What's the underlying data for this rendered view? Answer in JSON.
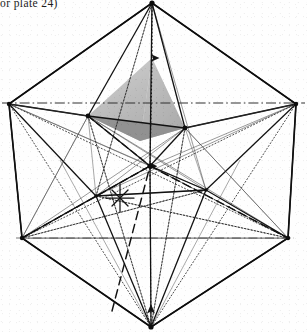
{
  "page": {
    "width": 307,
    "height": 332,
    "background_color": "#fefefe",
    "ink_color": "#141414"
  },
  "caption": {
    "text": "or plate  24)",
    "note": "partially cropped running caption fragment at top-left"
  },
  "figure": {
    "name": "polyhedron-with-inscribed-tetrahedron",
    "shaded_face_fill": "#bcbcbc",
    "shaded_face_fill_light": "#d2d2d2",
    "shaded_face_fill_dark": "#8e8e8e",
    "line_weights": {
      "outline": 1.6,
      "solid": 1.15,
      "thin": 0.7,
      "dashed": 1.3,
      "dotted": 0.85
    },
    "vertices": {
      "top_apex": {
        "x": 152,
        "y": 3
      },
      "bottom_apex": {
        "x": 151,
        "y": 327
      },
      "left_upper": {
        "x": 9,
        "y": 104
      },
      "right_upper": {
        "x": 296,
        "y": 104
      },
      "left_lower": {
        "x": 22,
        "y": 238
      },
      "right_lower": {
        "x": 288,
        "y": 238
      },
      "inner_left_up": {
        "x": 88,
        "y": 116
      },
      "inner_right_up": {
        "x": 185,
        "y": 128
      },
      "inner_center": {
        "x": 150,
        "y": 166
      },
      "inner_left_low": {
        "x": 96,
        "y": 196
      },
      "inner_right_low": {
        "x": 206,
        "y": 190
      },
      "tetra_apex": {
        "x": 152,
        "y": 58
      },
      "tetra_front": {
        "x": 140,
        "y": 140
      }
    },
    "arrow_markers": [
      {
        "name": "axis-arrow-upper",
        "x": 152,
        "y": 60
      },
      {
        "name": "axis-arrow-mid",
        "x": 150,
        "y": 166
      },
      {
        "name": "axis-arrow-lower",
        "x": 151,
        "y": 313
      }
    ]
  }
}
